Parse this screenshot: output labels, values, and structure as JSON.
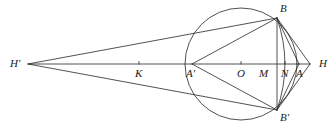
{
  "figure": {
    "type": "geometry-diagram",
    "stroke_color": "#262626",
    "background_color": "#ffffff",
    "width": 334,
    "height": 127
  },
  "circle": {
    "center": {
      "x": 241,
      "y": 64
    },
    "radius": 56,
    "center_label": "O"
  },
  "points": [
    {
      "label": "H'",
      "x": 28,
      "y": 64,
      "label_x": 10,
      "label_y": 58,
      "on_axis": true
    },
    {
      "label": "K",
      "x": 139,
      "y": 64,
      "label_x": 135,
      "label_y": 68,
      "on_axis": true
    },
    {
      "label": "A'",
      "x": 192,
      "y": 64,
      "label_x": 186,
      "label_y": 68,
      "on_axis": true
    },
    {
      "label": "O",
      "x": 241,
      "y": 64,
      "label_x": 237,
      "label_y": 68,
      "on_axis": true
    },
    {
      "label": "M",
      "x": 264,
      "y": 64,
      "label_x": 259,
      "label_y": 68,
      "on_axis": true
    },
    {
      "label": "N",
      "x": 285,
      "y": 64,
      "label_x": 281,
      "label_y": 68,
      "on_axis": true
    },
    {
      "label": "A",
      "x": 299,
      "y": 64,
      "label_x": 296,
      "label_y": 68,
      "on_axis": true
    },
    {
      "label": "H",
      "x": 310,
      "y": 64,
      "label_x": 319,
      "label_y": 58,
      "on_axis": true
    },
    {
      "label": "B",
      "x": 277,
      "y": 18,
      "label_x": 280,
      "label_y": 3,
      "on_axis": false
    },
    {
      "label": "B'",
      "x": 277,
      "y": 110,
      "label_x": 280,
      "label_y": 112,
      "on_axis": false
    }
  ],
  "segments": [
    {
      "name": "axis-H-prime-to-H",
      "from": "H'",
      "to": "H"
    },
    {
      "name": "H-prime-to-B",
      "from": "H'",
      "to": "B"
    },
    {
      "name": "H-prime-to-B-prime",
      "from": "H'",
      "to": "B'"
    },
    {
      "name": "A-prime-to-B",
      "from": "A'",
      "to": "B"
    },
    {
      "name": "A-prime-to-B-prime",
      "from": "A'",
      "to": "B'"
    },
    {
      "name": "B-to-B-prime",
      "from": "B",
      "to": "B'"
    },
    {
      "name": "B-to-A",
      "from": "B",
      "to": "A"
    },
    {
      "name": "B-to-H",
      "from": "B",
      "to": "H"
    },
    {
      "name": "B-prime-to-A",
      "from": "B'",
      "to": "A"
    },
    {
      "name": "B-prime-to-H",
      "from": "B'",
      "to": "H"
    }
  ],
  "arcs": [
    {
      "name": "arc-B-to-B-prime-right",
      "from": "B",
      "to": "B'",
      "bulge_x": 293
    }
  ],
  "tick_marks": [
    {
      "name": "tick-K",
      "x": 139,
      "y": 64
    },
    {
      "name": "tick-O",
      "x": 241,
      "y": 64
    },
    {
      "name": "tick-N",
      "x": 285,
      "y": 64
    }
  ]
}
